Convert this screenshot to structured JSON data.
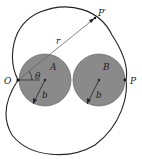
{
  "figure": {
    "type": "cardioid-diagram",
    "labels": {
      "origin": "O",
      "circle_a": "A",
      "circle_b": "B",
      "point_p": "P",
      "point_p_prime": "P′",
      "radius_r": "r",
      "angle": "θ",
      "radius_b_a": "b",
      "radius_b_b": "b"
    },
    "colors": {
      "circle_fill": "#8a8a8a",
      "stroke": "#222222",
      "line": "#444444"
    }
  }
}
